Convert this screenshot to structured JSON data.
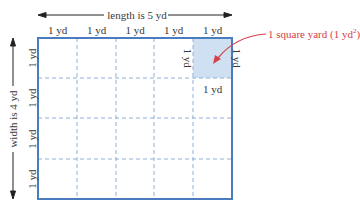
{
  "diagram": {
    "length_label": "length is 5 yd",
    "width_label": "width is 4 yd",
    "column_labels": [
      "1 yd",
      "1 yd",
      "1 yd",
      "1 yd",
      "1 yd"
    ],
    "row_labels": [
      "1 yd",
      "1 yd",
      "1 yd",
      "1 yd"
    ],
    "unit_square": {
      "left_label": "1 yd",
      "right_label": "1 yd",
      "bottom_label": "1 yd"
    },
    "callout": {
      "text": "1 square yard (1 yd",
      "superscript": "2",
      "close": ")"
    },
    "grid": {
      "columns": 5,
      "rows": 4
    },
    "colors": {
      "border": "#4a7cc0",
      "dashed": "#8fb0d8",
      "highlight": "#cfe0f3",
      "callout": "#d6404a",
      "arrow": "#333333"
    }
  }
}
